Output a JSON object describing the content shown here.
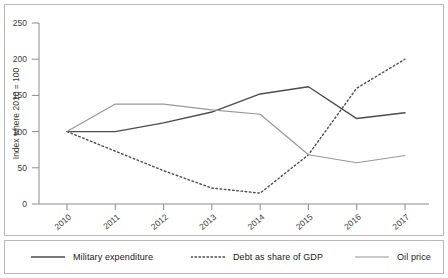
{
  "chart_data": {
    "type": "line",
    "title": "",
    "subtitle": "",
    "xlabel": "",
    "ylabel": "Index where 2010 = 100",
    "categories": [
      "2010",
      "2011",
      "2012",
      "2013",
      "2014",
      "2015",
      "2016",
      "2017"
    ],
    "x": [
      2010,
      2011,
      2012,
      2013,
      2014,
      2015,
      2016,
      2017
    ],
    "xtick_labels": [
      "2010",
      "2011",
      "2012",
      "2013",
      "2014",
      "2015",
      "2016",
      "2017"
    ],
    "xtick_rotation": -40,
    "ytick_labels": [
      "0",
      "50",
      "100",
      "150",
      "200",
      "250"
    ],
    "yticks": [
      0,
      50,
      100,
      150,
      200,
      250
    ],
    "ylim": [
      0,
      250
    ],
    "grid": false,
    "legend_position": "bottom",
    "series": [
      {
        "name": "Military expenditure",
        "style": "solid",
        "color": "#4d4d4d",
        "width": 1.4,
        "values": [
          100,
          100,
          112,
          127,
          152,
          162,
          118,
          126
        ]
      },
      {
        "name": "Debt as share of GDP",
        "style": "dotted",
        "color": "#4d4d4d",
        "width": 1.4,
        "values": [
          100,
          73,
          46,
          22,
          15,
          68,
          160,
          200
        ]
      },
      {
        "name": "Oil price",
        "style": "solid",
        "color": "#989898",
        "width": 1.2,
        "values": [
          100,
          138,
          138,
          130,
          124,
          68,
          57,
          67
        ]
      }
    ]
  },
  "legend": {
    "items": [
      {
        "label": "Military expenditure",
        "style": "solid",
        "color": "#4d4d4d"
      },
      {
        "label": "Debt as share of GDP",
        "style": "dotted",
        "color": "#4d4d4d"
      },
      {
        "label": "Oil price",
        "style": "solid",
        "color": "#989898"
      }
    ]
  },
  "axis": {
    "y_title": "Index where 2010 = 100",
    "axis_color": "#8c8c8c",
    "tick_text_color": "#3a3a3a"
  }
}
